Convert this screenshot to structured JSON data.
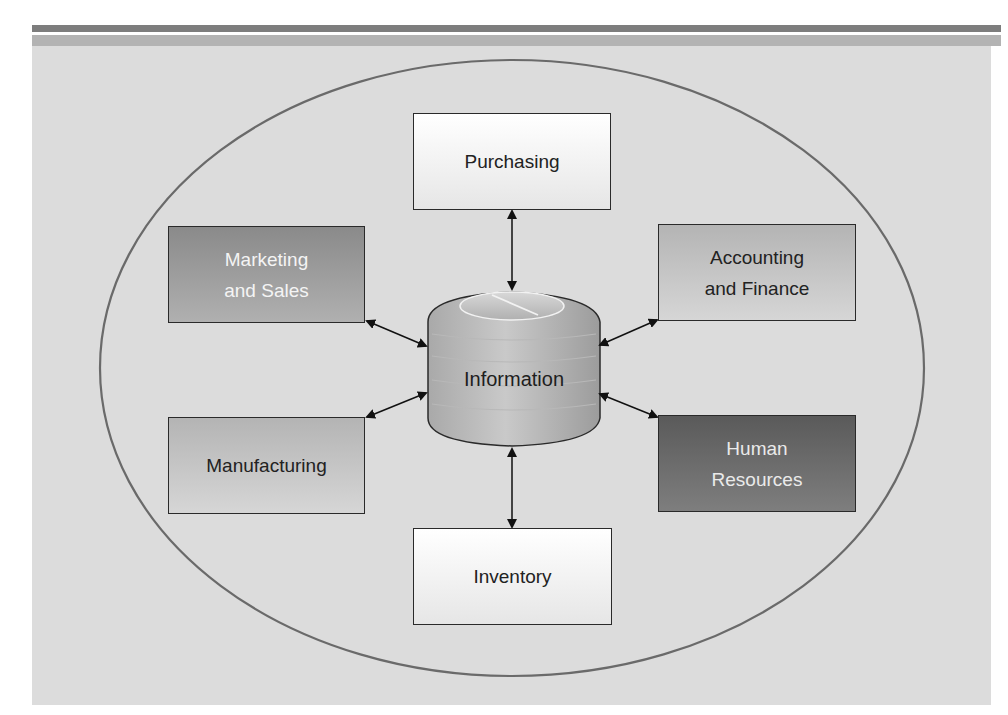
{
  "diagram": {
    "title": "",
    "center": {
      "label": "Information",
      "shape": "database-cylinder"
    },
    "departments": [
      {
        "id": "purchasing",
        "label": "Purchasing",
        "position": "top"
      },
      {
        "id": "marketing",
        "label": "Marketing and Sales",
        "line1": "Marketing",
        "line2": "and Sales",
        "position": "upper-left"
      },
      {
        "id": "accounting",
        "label": "Accounting and Finance",
        "line1": "Accounting",
        "line2": "and Finance",
        "position": "upper-right"
      },
      {
        "id": "manufacturing",
        "label": "Manufacturing",
        "position": "lower-left"
      },
      {
        "id": "hr",
        "label": "Human Resources",
        "line1": "Human",
        "line2": "Resources",
        "position": "lower-right"
      },
      {
        "id": "inventory",
        "label": "Inventory",
        "position": "bottom"
      }
    ],
    "connections": [
      {
        "from": "Purchasing",
        "to": "Information",
        "type": "bidirectional"
      },
      {
        "from": "Marketing and Sales",
        "to": "Information",
        "type": "bidirectional"
      },
      {
        "from": "Accounting and Finance",
        "to": "Information",
        "type": "bidirectional"
      },
      {
        "from": "Manufacturing",
        "to": "Information",
        "type": "bidirectional"
      },
      {
        "from": "Human Resources",
        "to": "Information",
        "type": "bidirectional"
      },
      {
        "from": "Inventory",
        "to": "Information",
        "type": "bidirectional"
      }
    ],
    "colors": {
      "panel": "#dcdcdc",
      "ellipse_stroke": "#6a6a6a",
      "header_bar_dark": "#7d7d7d",
      "header_bar_light": "#b3b3b3"
    }
  }
}
